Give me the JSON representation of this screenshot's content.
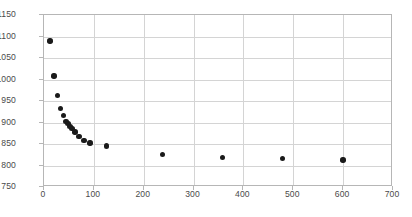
{
  "chart_data": {
    "type": "scatter",
    "title": "",
    "xlabel": "",
    "ylabel": "",
    "xlim": [
      0,
      700
    ],
    "ylim": [
      750,
      1150
    ],
    "xticks": [
      0,
      100,
      200,
      300,
      400,
      500,
      600,
      700
    ],
    "yticks": [
      750,
      800,
      850,
      900,
      950,
      1000,
      1050,
      1100,
      1150
    ],
    "grid": true,
    "legend": "none",
    "marker_color": "#1a1a1a",
    "gridline_color": "#d4d4d4",
    "axis_color": "#b6b6b6",
    "tick_label_color": "#4a4a4a",
    "series": [
      {
        "name": "series-1",
        "points": [
          {
            "x": 12,
            "y": 1090
          },
          {
            "x": 20,
            "y": 1008
          },
          {
            "x": 27,
            "y": 963
          },
          {
            "x": 33,
            "y": 933
          },
          {
            "x": 39,
            "y": 916
          },
          {
            "x": 44,
            "y": 903
          },
          {
            "x": 48,
            "y": 897
          },
          {
            "x": 52,
            "y": 891
          },
          {
            "x": 56,
            "y": 886
          },
          {
            "x": 62,
            "y": 878
          },
          {
            "x": 70,
            "y": 867
          },
          {
            "x": 80,
            "y": 858
          },
          {
            "x": 92,
            "y": 852
          },
          {
            "x": 125,
            "y": 845
          },
          {
            "x": 238,
            "y": 825
          },
          {
            "x": 358,
            "y": 819
          },
          {
            "x": 478,
            "y": 816
          },
          {
            "x": 600,
            "y": 813
          }
        ]
      }
    ]
  }
}
